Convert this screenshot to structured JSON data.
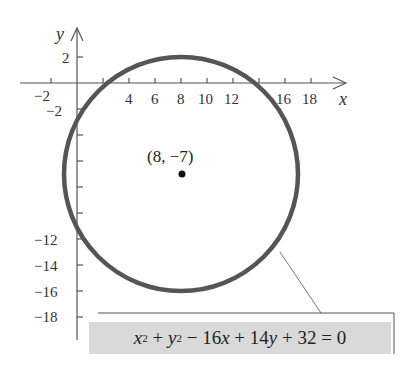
{
  "diagram": {
    "type": "circle-on-cartesian-plane",
    "axes": {
      "x_label": "x",
      "y_label": "y",
      "x_ticks": [
        "−2",
        "4",
        "6",
        "8",
        "10",
        "12",
        "16",
        "18"
      ],
      "y_ticks_positive": [
        "2"
      ],
      "y_ticks_negative": [
        "−2",
        "−12",
        "−14",
        "−16",
        "−18"
      ]
    },
    "circle": {
      "center": [
        8,
        -7
      ],
      "radius": 9,
      "stroke_color": "#555555"
    },
    "center_label": "(8, −7)",
    "equation": {
      "x_var": "x",
      "x_exp": "2",
      "plus1": " + ",
      "y_var": "y",
      "y_exp": "2",
      "rest1": " − 16",
      "x_var2": "x",
      "rest2": " + 14",
      "y_var2": "y",
      "rest3": " + 32 = 0",
      "full_text": "x² + y² − 16x + 14y + 32 = 0",
      "box_color": "#d9d9d9"
    }
  }
}
